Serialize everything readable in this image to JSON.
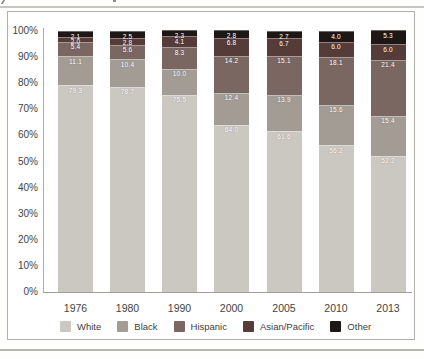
{
  "figure": {
    "kind": "stacked-bar-chart-figure",
    "border_color": "#b2b0ab",
    "axis_color": "#a19f9a",
    "text_color": "#45443f"
  },
  "chart_data": {
    "type": "bar",
    "stacked": true,
    "title": "",
    "xlabel": "",
    "ylabel": "",
    "categories": [
      "1976",
      "1980",
      "1990",
      "2000",
      "2005",
      "2010",
      "2013"
    ],
    "series": [
      {
        "name": "White",
        "color": "#cbc8c2",
        "values": [
          79.3,
          78.7,
          75.5,
          64.0,
          61.6,
          56.2,
          52.2
        ]
      },
      {
        "name": "Black",
        "color": "#a39c95",
        "values": [
          11.1,
          10.4,
          10.0,
          12.4,
          13.9,
          15.6,
          15.4
        ]
      },
      {
        "name": "Hispanic",
        "color": "#7b6761",
        "values": [
          5.4,
          5.6,
          8.3,
          14.2,
          15.1,
          18.1,
          21.4
        ]
      },
      {
        "name": "Asian/Pacific",
        "color": "#563c39",
        "values": [
          2.0,
          2.8,
          4.1,
          6.8,
          6.7,
          6.0,
          6.0
        ]
      },
      {
        "name": "Other",
        "color": "#1d1815",
        "values": [
          2.1,
          2.5,
          2.3,
          2.8,
          2.7,
          4.0,
          5.3
        ]
      }
    ],
    "yticks": [
      "100%",
      "90%",
      "80%",
      "70%",
      "60%",
      "50%",
      "40%",
      "30%",
      "20%",
      "10%",
      "0%"
    ],
    "ylim": [
      0,
      100
    ],
    "grid": false,
    "value_labels": true,
    "value_label_color": "#ffffff",
    "legend_position": "bottom"
  }
}
